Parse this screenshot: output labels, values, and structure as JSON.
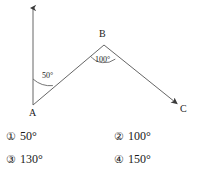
{
  "diagram": {
    "type": "geometry-angle-diagram",
    "stroke_color": "#555555",
    "text_color": "#1a1a1a",
    "background_color": "#ffffff",
    "points": {
      "A": {
        "label": "A",
        "x": 33,
        "y": 105
      },
      "B": {
        "label": "B",
        "x": 104,
        "y": 45
      },
      "C": {
        "label": "C",
        "x": 178,
        "y": 104
      }
    },
    "rays": [
      {
        "name": "ray-A-up",
        "from": "A",
        "to_x": 33,
        "to_y": 5,
        "arrow": true
      },
      {
        "name": "segment-A-B",
        "from": "A",
        "to": "B",
        "arrow": false
      },
      {
        "name": "ray-B-C",
        "from": "B",
        "to": "C",
        "arrow": true
      }
    ],
    "angles": [
      {
        "name": "angle-at-A",
        "vertex": "A",
        "label": "50°",
        "value": 50
      },
      {
        "name": "angle-at-B",
        "vertex": "B",
        "label": "100°",
        "value": 100
      }
    ]
  },
  "options": [
    {
      "marker": "①",
      "text": "50°"
    },
    {
      "marker": "②",
      "text": "100°"
    },
    {
      "marker": "③",
      "text": "130°"
    },
    {
      "marker": "④",
      "text": "150°"
    }
  ]
}
